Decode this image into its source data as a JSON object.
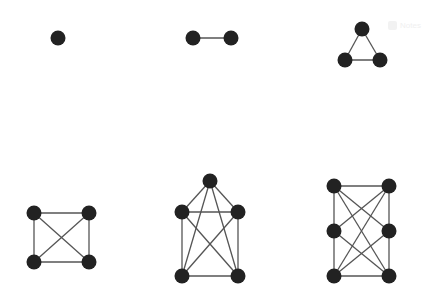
{
  "watermark": {
    "label": "Notes",
    "icon": "play-icon"
  },
  "diagram": {
    "node_color": "#222222",
    "edge_color": "#555555",
    "graphs": [
      {
        "id": "g1",
        "vertices": [
          "a"
        ],
        "edges": []
      },
      {
        "id": "g2",
        "vertices": [
          "a",
          "b"
        ],
        "edges": [
          [
            "a",
            "b"
          ]
        ]
      },
      {
        "id": "g3",
        "vertices": [
          "a",
          "b",
          "c"
        ],
        "edges": [
          [
            "a",
            "b"
          ],
          [
            "b",
            "c"
          ],
          [
            "a",
            "c"
          ]
        ]
      },
      {
        "id": "g4",
        "vertices": [
          "tl",
          "tr",
          "bl",
          "br"
        ],
        "edges": [
          [
            "tl",
            "tr"
          ],
          [
            "tl",
            "bl"
          ],
          [
            "tr",
            "br"
          ],
          [
            "bl",
            "br"
          ],
          [
            "tl",
            "br"
          ],
          [
            "tr",
            "bl"
          ]
        ]
      },
      {
        "id": "g5",
        "vertices": [
          "t",
          "l",
          "r",
          "bl",
          "br"
        ],
        "edges": [
          [
            "t",
            "l"
          ],
          [
            "t",
            "r"
          ],
          [
            "t",
            "bl"
          ],
          [
            "t",
            "br"
          ],
          [
            "l",
            "r"
          ],
          [
            "l",
            "bl"
          ],
          [
            "l",
            "br"
          ],
          [
            "r",
            "bl"
          ],
          [
            "r",
            "br"
          ],
          [
            "bl",
            "br"
          ]
        ]
      },
      {
        "id": "g6",
        "vertices": [
          "l1",
          "r1",
          "l2",
          "r2",
          "l3",
          "r3"
        ],
        "edges": [
          [
            "l1",
            "r1"
          ],
          [
            "l1",
            "l2"
          ],
          [
            "l2",
            "l3"
          ],
          [
            "l3",
            "r3"
          ],
          [
            "r1",
            "r2"
          ],
          [
            "r2",
            "r3"
          ],
          [
            "l1",
            "r2"
          ],
          [
            "l1",
            "r3"
          ],
          [
            "r1",
            "l2"
          ],
          [
            "r1",
            "l3"
          ],
          [
            "l2",
            "r3"
          ],
          [
            "r2",
            "l3"
          ]
        ]
      }
    ]
  }
}
